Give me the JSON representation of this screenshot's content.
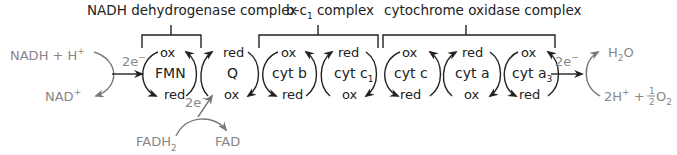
{
  "complexes": [
    {
      "label": "NADH dehydrogenase complex"
    },
    {
      "label": "b-c",
      "sub": "1",
      "label_suffix": " complex"
    },
    {
      "label": "cytochrome oxidase complex"
    }
  ],
  "carriers": [
    {
      "name": "FMN",
      "top": "ox",
      "bottom": "red"
    },
    {
      "name": "Q",
      "top": "red",
      "bottom": "ox"
    },
    {
      "name": "cyt b",
      "top": "ox",
      "bottom": "red"
    },
    {
      "name": "cyt c",
      "sub": "1",
      "top": "red",
      "bottom": "ox"
    },
    {
      "name": "cyt c",
      "top": "ox",
      "bottom": "red"
    },
    {
      "name": "cyt a",
      "top": "red",
      "bottom": "ox"
    },
    {
      "name": "cyt a",
      "sub": "3",
      "top": "ox",
      "bottom": "red"
    }
  ],
  "inputs": {
    "nadh": "NADH + H",
    "nadh_sup": "+",
    "nad": "NAD",
    "nad_sup": "+",
    "fadh2": "FADH",
    "fadh2_sub": "2",
    "fad": "FAD",
    "electrons": "2e",
    "electrons_sup": "−"
  },
  "outputs": {
    "h2o_h": "H",
    "h2o_sub": "2",
    "h2o_o": "O",
    "proton": "2H",
    "proton_sup": "+",
    "plus": " + ",
    "half_num": "1",
    "half_den": "2",
    "o2": "O",
    "o2_sub": "2"
  },
  "colors": {
    "main": "#222222",
    "grey": "#888888"
  }
}
